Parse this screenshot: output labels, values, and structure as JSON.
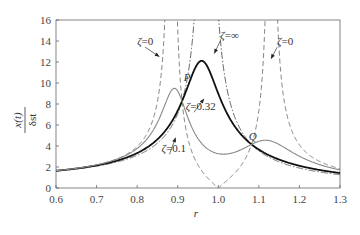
{
  "chart_data": {
    "type": "line",
    "title": "",
    "xlabel": "r",
    "ylabel": "x(t) / δst",
    "ylabel_numerator": "x(t)",
    "ylabel_denominator": "δst",
    "xlim": [
      0.6,
      1.3
    ],
    "ylim": [
      0,
      16
    ],
    "xticks": [
      "0.6",
      "0.7",
      "0.8",
      "0.9",
      "1.0",
      "1.1",
      "1.2",
      "1.3"
    ],
    "yticks": [
      "0",
      "2",
      "4",
      "6",
      "8",
      "10",
      "12",
      "14",
      "16"
    ],
    "grid": false,
    "legend": "none (inline annotations)",
    "model": {
      "mass_ratio_mu": 0.06,
      "tuning_f": 1.0
    },
    "x_samples": [
      0.6,
      0.7,
      0.8,
      0.85,
      0.9,
      0.95,
      1.0,
      1.05,
      1.1,
      1.15,
      1.2,
      1.3
    ],
    "series": [
      {
        "name": "ζ=0",
        "zeta": 0,
        "style": "dashed",
        "color": "#777777",
        "values": [
          1.04,
          1.57,
          3.2,
          6.9,
          null,
          null,
          0.0,
          1.6,
          11.0,
          null,
          5.8,
          2.2
        ]
      },
      {
        "name": "ζ=∞",
        "zeta": "inf",
        "style": "dashdot",
        "color": "#555555",
        "values": [
          1.0,
          1.4,
          2.4,
          3.5,
          6.5,
          30.0,
          16.7,
          5.0,
          2.6,
          1.8,
          1.4,
          1.0
        ]
      },
      {
        "name": "ζ=0.32",
        "zeta": 0.32,
        "style": "solid-bold",
        "color": "#111111",
        "values": [
          1.0,
          1.45,
          2.5,
          3.7,
          7.8,
          13.6,
          12.3,
          6.0,
          3.1,
          2.0,
          1.5,
          1.05
        ]
      },
      {
        "name": "ζ=0.1",
        "zeta": 0.1,
        "style": "solid-thin",
        "color": "#888888",
        "values": [
          1.05,
          1.75,
          3.2,
          5.0,
          9.5,
          7.2,
          3.8,
          3.9,
          4.4,
          3.6,
          2.6,
          1.5
        ]
      }
    ],
    "annotations": [
      {
        "text": "ζ=0",
        "x": 0.8,
        "y": 13.6,
        "arrow_to": [
          0.855,
          12.5
        ]
      },
      {
        "text": "ζ=∞",
        "x": 1.005,
        "y": 14.2,
        "arrow_to": [
          0.99,
          12.8
        ]
      },
      {
        "text": "ζ=0",
        "x": 1.145,
        "y": 13.6,
        "arrow_to": [
          1.13,
          12.3
        ]
      },
      {
        "text": "ζ=0.32",
        "x": 0.92,
        "y": 7.4,
        "arrow_to": [
          0.965,
          8.5
        ]
      },
      {
        "text": "ζ=0.1",
        "x": 0.86,
        "y": 3.4,
        "arrow_to": [
          0.895,
          4.8
        ]
      },
      {
        "text": "P",
        "x": 0.915,
        "y": 10.2,
        "point": [
          0.91,
          9.5
        ]
      },
      {
        "text": "Q",
        "x": 1.075,
        "y": 4.6,
        "point": [
          1.075,
          3.7
        ]
      }
    ]
  }
}
